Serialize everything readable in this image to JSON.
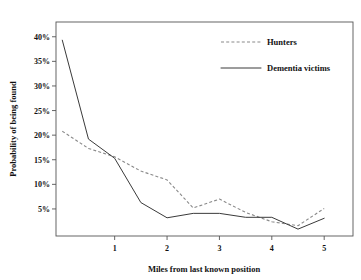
{
  "chart_data": {
    "type": "line",
    "title": "",
    "xlabel": "Miles from last known position",
    "ylabel": "Probability of being found",
    "xlim": [
      -0.12,
      5.55
    ],
    "ylim": [
      -0.5,
      43
    ],
    "xticks": [
      1,
      2,
      3,
      4,
      5
    ],
    "xtick_labels": [
      "1",
      "2",
      "3",
      "4",
      "5"
    ],
    "yticks": [
      5,
      10,
      15,
      20,
      25,
      30,
      35,
      40
    ],
    "ytick_labels": [
      "5%",
      "10%",
      "15%",
      "20%",
      "25%",
      "30%",
      "35%",
      "40%"
    ],
    "grid": false,
    "legend_position": "upper right",
    "x": [
      0,
      0.5,
      1,
      1.5,
      2,
      2.5,
      3,
      3.5,
      4,
      4.5,
      5
    ],
    "series": [
      {
        "name": "Hunters",
        "style": "dashed",
        "color": "#8a8a8a",
        "values": [
          20.8,
          17.3,
          15.6,
          12.7,
          10.9,
          5.2,
          7.0,
          4.3,
          2.4,
          1.6,
          5.1
        ]
      },
      {
        "name": "Dementia victims",
        "style": "solid",
        "color": "#3a3a3a",
        "values": [
          39.3,
          19.2,
          15.3,
          6.3,
          3.2,
          4.1,
          4.1,
          3.3,
          3.3,
          0.9,
          3.1
        ]
      }
    ]
  },
  "legend": {
    "entries": [
      {
        "label": "Hunters",
        "style": "dashed"
      },
      {
        "label": "Dementia victims",
        "style": "solid"
      }
    ]
  }
}
